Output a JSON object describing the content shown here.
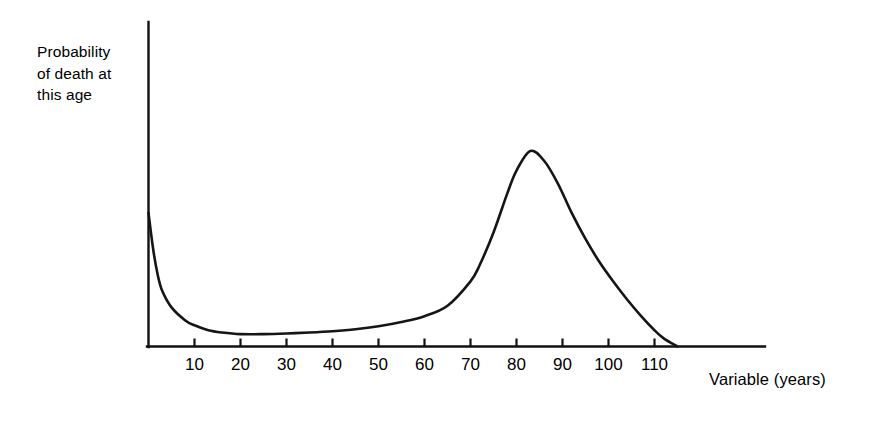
{
  "figure": {
    "background_color": "#ffffff",
    "line_color": "#151515",
    "axis_color": "#111111"
  },
  "axes": {
    "y_label": "Probability\nof death at\nthis age",
    "x_label": "Variable (years)"
  },
  "chart_data": {
    "type": "line",
    "title": "",
    "subtitle": "",
    "xlabel": "Variable (years)",
    "ylabel": "Probability of death at this age",
    "xlim": [
      0,
      124
    ],
    "ylim": [
      0,
      1
    ],
    "grid": false,
    "legend": null,
    "annotations": [],
    "x_tick_labels": [
      "10",
      "20",
      "30",
      "40",
      "50",
      "60",
      "70",
      "80",
      "90",
      "100",
      "110"
    ],
    "x_ticks": [
      10,
      20,
      30,
      40,
      50,
      60,
      70,
      80,
      90,
      100,
      110
    ],
    "y_ticks": [],
    "y_tick_labels": [],
    "series": [
      {
        "name": "Probability of death at this age",
        "x": [
          0,
          1,
          2,
          3,
          5,
          8,
          10,
          13,
          16,
          20,
          25,
          30,
          35,
          40,
          45,
          50,
          55,
          60,
          65,
          70,
          72,
          75,
          78,
          80,
          83,
          86,
          89,
          92,
          95,
          98,
          101,
          104,
          107,
          110,
          112,
          115
        ],
        "y": [
          0.41,
          0.3,
          0.22,
          0.17,
          0.12,
          0.08,
          0.065,
          0.05,
          0.043,
          0.038,
          0.038,
          0.04,
          0.043,
          0.047,
          0.053,
          0.062,
          0.075,
          0.093,
          0.125,
          0.2,
          0.25,
          0.35,
          0.47,
          0.54,
          0.6,
          0.57,
          0.5,
          0.41,
          0.33,
          0.26,
          0.2,
          0.145,
          0.095,
          0.05,
          0.025,
          0.0
        ]
      }
    ]
  }
}
